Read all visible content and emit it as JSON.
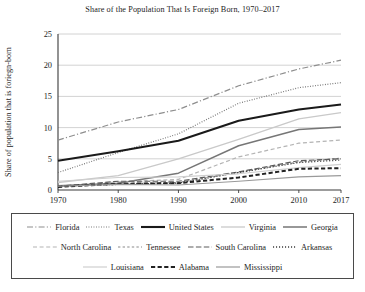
{
  "chart_data": {
    "type": "line",
    "title": "Share of the Population That Is Foreign Born, 1970–2017",
    "xlabel": "",
    "ylabel": "Share of population that is foriegn-born",
    "x": [
      1970,
      1980,
      1990,
      2000,
      2010,
      2017
    ],
    "xtick_labels": [
      "1970",
      "1980",
      "1990",
      "2000",
      "2010",
      "2017"
    ],
    "ytick_labels": [
      "0",
      "5",
      "10",
      "15",
      "20",
      "25"
    ],
    "yticks": [
      0,
      5,
      10,
      15,
      20,
      25
    ],
    "xlim": [
      1970,
      2017
    ],
    "ylim": [
      0,
      25
    ],
    "grid": "horizontal",
    "legend_position": "below-plot",
    "series": [
      {
        "name": "Florida",
        "values": [
          8.0,
          10.9,
          12.9,
          16.7,
          19.4,
          20.8
        ],
        "style": "dashdot",
        "color": "#8e8e8e",
        "width": 1.2
      },
      {
        "name": "Texas",
        "values": [
          2.8,
          6.0,
          9.0,
          13.9,
          16.4,
          17.2
        ],
        "style": "dotted",
        "color": "#6f6f6f",
        "width": 1.2
      },
      {
        "name": "United States",
        "values": [
          4.7,
          6.2,
          7.9,
          11.1,
          12.9,
          13.7
        ],
        "style": "solid",
        "color": "#1a1a1a",
        "width": 2.1
      },
      {
        "name": "Virginia",
        "values": [
          1.2,
          2.3,
          5.0,
          8.1,
          11.4,
          12.4
        ],
        "style": "solid",
        "color": "#c9c9c9",
        "width": 1.3
      },
      {
        "name": "Georgia",
        "values": [
          0.7,
          1.1,
          2.7,
          7.1,
          9.7,
          10.1
        ],
        "style": "solid",
        "color": "#767676",
        "width": 1.5
      },
      {
        "name": "North Carolina",
        "values": [
          0.5,
          1.3,
          1.7,
          5.3,
          7.5,
          8.0
        ],
        "style": "dashed",
        "color": "#b4b4b4",
        "width": 1.2
      },
      {
        "name": "Tennessee",
        "values": [
          0.6,
          1.0,
          1.2,
          2.8,
          4.5,
          5.1
        ],
        "style": "dashed-sm",
        "color": "#8a8a8a",
        "width": 1.2
      },
      {
        "name": "South Carolina",
        "values": [
          0.6,
          1.4,
          1.4,
          2.9,
          4.7,
          5.0
        ],
        "style": "dash-long",
        "color": "#5c5c5c",
        "width": 1.2
      },
      {
        "name": "Arkansas",
        "values": [
          0.6,
          0.9,
          1.1,
          2.8,
          4.4,
          4.8
        ],
        "style": "dotted-lg",
        "color": "#3d3d3d",
        "width": 1.3
      },
      {
        "name": "Louisiana",
        "values": [
          1.4,
          2.0,
          2.1,
          2.6,
          3.6,
          4.1
        ],
        "style": "solid",
        "color": "#cfcfcf",
        "width": 1.2
      },
      {
        "name": "Alabama",
        "values": [
          0.5,
          1.0,
          1.1,
          2.0,
          3.4,
          3.5
        ],
        "style": "dashed-bold",
        "color": "#222222",
        "width": 2.0
      },
      {
        "name": "Mississippi",
        "values": [
          0.6,
          0.9,
          0.8,
          1.4,
          2.1,
          2.3
        ],
        "style": "solid",
        "color": "#9a9a9a",
        "width": 1.2
      }
    ]
  },
  "legend": {
    "rows": [
      [
        "Florida",
        "Texas",
        "United States",
        "Virginia",
        "Georgia"
      ],
      [
        "North Carolina",
        "Tennessee",
        "South Carolina",
        "Arkansas"
      ],
      [
        "Louisiana",
        "Alabama",
        "Mississippi"
      ]
    ]
  }
}
